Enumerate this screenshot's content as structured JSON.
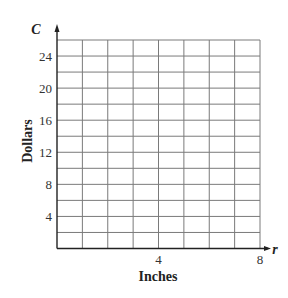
{
  "chart_data": {
    "type": "line",
    "title": "",
    "xlabel": "Inches",
    "ylabel": "Dollars",
    "x_variable": "r",
    "y_variable": "C",
    "xlim": [
      0,
      8
    ],
    "ylim": [
      0,
      26
    ],
    "x_ticks": [
      4,
      8
    ],
    "y_ticks": [
      4,
      8,
      12,
      16,
      20,
      24
    ],
    "x_grid_step": 1,
    "y_grid_step": 2,
    "grid": true,
    "series": [],
    "legend": null
  },
  "colors": {
    "grid": "#7a7a7a",
    "axis": "#222222",
    "text": "#222222"
  }
}
